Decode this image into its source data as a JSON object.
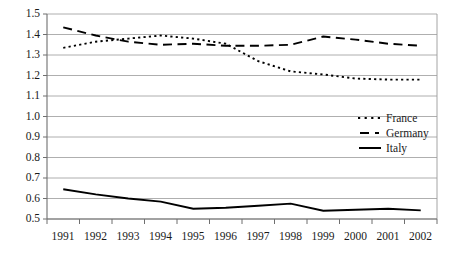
{
  "chart_data": {
    "type": "line",
    "title": "",
    "xlabel": "",
    "ylabel": "",
    "categories": [
      "1991",
      "1992",
      "1993",
      "1994",
      "1995",
      "1996",
      "1997",
      "1998",
      "1999",
      "2000",
      "2001",
      "2002"
    ],
    "x": [
      1991,
      1992,
      1993,
      1994,
      1995,
      1996,
      1997,
      1998,
      1999,
      2000,
      2001,
      2002
    ],
    "ylim": [
      0.5,
      1.5
    ],
    "yticks": [
      "0.5",
      "0.6",
      "0.7",
      "0.8",
      "0.9",
      "1.0",
      "1.1",
      "1.2",
      "1.3",
      "1.4",
      "1.5"
    ],
    "ytick_values": [
      0.5,
      0.6,
      0.7,
      0.8,
      0.9,
      1.0,
      1.1,
      1.2,
      1.3,
      1.4,
      1.5
    ],
    "grid": true,
    "legend_position": "center-right",
    "series": [
      {
        "name": "France",
        "style": "dotted",
        "color": "#000000",
        "values": [
          1.335,
          1.365,
          1.38,
          1.395,
          1.38,
          1.355,
          1.27,
          1.22,
          1.205,
          1.185,
          1.18,
          1.18
        ]
      },
      {
        "name": "Germany",
        "style": "dashed",
        "color": "#000000",
        "values": [
          1.435,
          1.395,
          1.365,
          1.35,
          1.355,
          1.345,
          1.345,
          1.35,
          1.39,
          1.375,
          1.355,
          1.345
        ]
      },
      {
        "name": "Italy",
        "style": "solid",
        "color": "#000000",
        "values": [
          0.645,
          0.62,
          0.6,
          0.585,
          0.55,
          0.555,
          0.565,
          0.575,
          0.54,
          0.545,
          0.55,
          0.542
        ]
      }
    ]
  },
  "axis": {
    "ytick_labels": [
      "1.5",
      "1.4",
      "1.3",
      "1.2",
      "1.1",
      "1.0",
      "0.9",
      "0.8",
      "0.7",
      "0.6",
      "0.5"
    ],
    "xtick_labels": [
      "1991",
      "1992",
      "1993",
      "1994",
      "1995",
      "1996",
      "1997",
      "1998",
      "1999",
      "2000",
      "2001",
      "2002"
    ]
  },
  "legend": {
    "items": [
      {
        "label": "France",
        "marker": "dotted-line-swatch"
      },
      {
        "label": "Germany",
        "marker": "dashed-line-swatch"
      },
      {
        "label": "Italy",
        "marker": "solid-line-swatch"
      }
    ]
  },
  "colors": {
    "series_line": "#000000",
    "gridline": "#9a9a9a",
    "axis": "#8a8a8a",
    "background": "#ffffff",
    "text": "#1a1a1a"
  }
}
